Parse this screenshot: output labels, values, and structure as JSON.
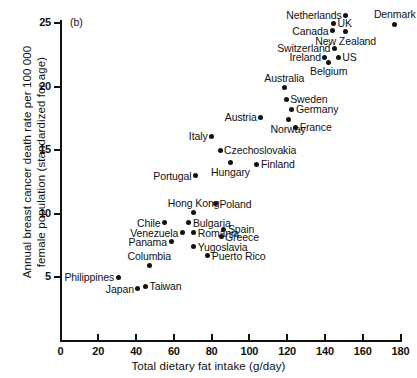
{
  "figure": {
    "panel_label": "(b)",
    "background_color": "#ffffff",
    "ink_color": "#111111"
  },
  "chart_data": {
    "type": "scatter",
    "title": "",
    "xlabel": "Total dietary fat intake (g/day)",
    "ylabel": "Annual breast cancer death rate per 100 000 female population (standardized for age)",
    "ylabel_line1": "Annual breast cancer death rate per 100 000",
    "ylabel_line2": "female population (standardized for age)",
    "xlim": [
      0,
      180
    ],
    "ylim": [
      0,
      25
    ],
    "xticks": [
      0,
      20,
      40,
      60,
      80,
      100,
      120,
      140,
      160,
      180
    ],
    "yticks": [
      5,
      10,
      15,
      20,
      25
    ],
    "grid": false,
    "legend": "none",
    "points": [
      {
        "name": "Netherlands",
        "x": 151.0,
        "y": 25.6,
        "label_pos": "left"
      },
      {
        "name": "UK",
        "x": 144.5,
        "y": 25.0,
        "label_pos": "right"
      },
      {
        "name": "Denmark",
        "x": 177.0,
        "y": 24.9,
        "label_pos": "above"
      },
      {
        "name": "Canada",
        "x": 144.0,
        "y": 24.4,
        "label_pos": "left"
      },
      {
        "name": "New Zealand",
        "x": 151.0,
        "y": 24.3,
        "label_pos": "below"
      },
      {
        "name": "Switzerland",
        "x": 145.0,
        "y": 23.0,
        "label_pos": "left"
      },
      {
        "name": "Ireland",
        "x": 140.0,
        "y": 22.3,
        "label_pos": "left"
      },
      {
        "name": "US",
        "x": 147.0,
        "y": 22.3,
        "label_pos": "right"
      },
      {
        "name": "Belgium",
        "x": 142.0,
        "y": 21.9,
        "label_pos": "below"
      },
      {
        "name": "Australia",
        "x": 118.5,
        "y": 19.9,
        "label_pos": "above"
      },
      {
        "name": "Sweden",
        "x": 119.5,
        "y": 19.0,
        "label_pos": "right"
      },
      {
        "name": "Germany",
        "x": 122.5,
        "y": 18.2,
        "label_pos": "right"
      },
      {
        "name": "Austria",
        "x": 106.0,
        "y": 17.6,
        "label_pos": "left"
      },
      {
        "name": "Norway",
        "x": 120.5,
        "y": 17.4,
        "label_pos": "below"
      },
      {
        "name": "France",
        "x": 124.5,
        "y": 16.8,
        "label_pos": "right"
      },
      {
        "name": "Italy",
        "x": 80.0,
        "y": 16.1,
        "label_pos": "left"
      },
      {
        "name": "Czechoslovakia",
        "x": 84.5,
        "y": 15.0,
        "label_pos": "right"
      },
      {
        "name": "Hungary",
        "x": 90.0,
        "y": 14.0,
        "label_pos": "below"
      },
      {
        "name": "Finland",
        "x": 104.0,
        "y": 13.9,
        "label_pos": "right"
      },
      {
        "name": "Portugal",
        "x": 71.5,
        "y": 13.0,
        "label_pos": "left"
      },
      {
        "name": "Poland",
        "x": 82.0,
        "y": 10.8,
        "label_pos": "right"
      },
      {
        "name": "Hong Kong",
        "x": 70.5,
        "y": 10.1,
        "label_pos": "above"
      },
      {
        "name": "Chile",
        "x": 55.0,
        "y": 9.3,
        "label_pos": "left"
      },
      {
        "name": "Bulgaria",
        "x": 68.0,
        "y": 9.3,
        "label_pos": "right"
      },
      {
        "name": "Spain",
        "x": 86.5,
        "y": 8.8,
        "label_pos": "right"
      },
      {
        "name": "Venezuela",
        "x": 64.5,
        "y": 8.5,
        "label_pos": "left"
      },
      {
        "name": "Romania",
        "x": 70.5,
        "y": 8.5,
        "label_pos": "right"
      },
      {
        "name": "Greece",
        "x": 85.0,
        "y": 8.2,
        "label_pos": "right"
      },
      {
        "name": "Panama",
        "x": 58.5,
        "y": 7.8,
        "label_pos": "left"
      },
      {
        "name": "Yugoslavia",
        "x": 70.5,
        "y": 7.4,
        "label_pos": "right"
      },
      {
        "name": "Puerto Rico",
        "x": 78.0,
        "y": 6.7,
        "label_pos": "right"
      },
      {
        "name": "Columbia",
        "x": 47.0,
        "y": 5.9,
        "label_pos": "above"
      },
      {
        "name": "Philippines",
        "x": 30.5,
        "y": 5.0,
        "label_pos": "left"
      },
      {
        "name": "Taiwan",
        "x": 45.0,
        "y": 4.3,
        "label_pos": "right"
      },
      {
        "name": "Japan",
        "x": 41.0,
        "y": 4.1,
        "label_pos": "left"
      }
    ]
  }
}
